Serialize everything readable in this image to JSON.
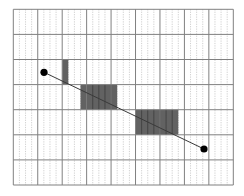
{
  "diagram": {
    "type": "line-rasterization-grid",
    "grid": {
      "left": 13.3,
      "top": 9.3,
      "width": 220,
      "height": 175.7,
      "major_columns": 9,
      "rows": 7,
      "subdivisions_per_column": 4
    },
    "shaded_runs": [
      {
        "row": 2,
        "sub_col_start": 8,
        "sub_col_end": 8
      },
      {
        "row": 3,
        "sub_col_start": 11,
        "sub_col_end": 16
      },
      {
        "row": 4,
        "sub_col_start": 20,
        "sub_col_end": 26
      }
    ],
    "line": {
      "start": {
        "x": 44,
        "y": 72.3
      },
      "end": {
        "x": 204,
        "y": 149
      }
    },
    "colors": {
      "background": "#ffffff",
      "major_grid": "#808080",
      "minor_grid": "#c4c4c4",
      "shade": "#5a5a5a",
      "line": "#3a3a3a",
      "endpoint": "#000000"
    }
  }
}
